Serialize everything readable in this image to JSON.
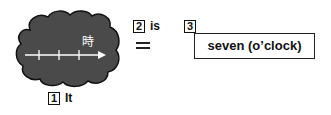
{
  "diagram": {
    "cloud": {
      "fill": "#4a4a4a",
      "outline": "#111111",
      "label": "時",
      "timeline": {
        "arrow_color": "#ffffff",
        "tick_count": 3
      }
    },
    "items": [
      {
        "number": "1",
        "word": "It"
      },
      {
        "number": "2",
        "word": "is",
        "symbol": "="
      },
      {
        "number": "3",
        "word": "seven (o’clock)"
      }
    ]
  }
}
